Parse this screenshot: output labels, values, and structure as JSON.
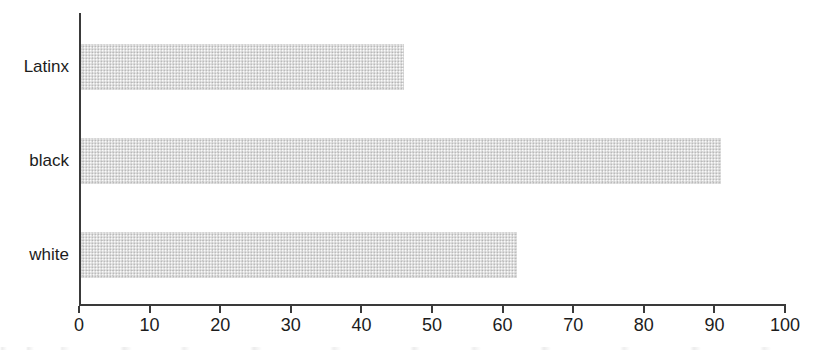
{
  "chart_data": {
    "type": "bar",
    "orientation": "horizontal",
    "title": "",
    "subtitle": "",
    "xlabel": "",
    "ylabel": "",
    "categories": [
      "Latinx",
      "black",
      "white"
    ],
    "values": [
      46,
      91,
      62
    ],
    "series": [
      {
        "name": "",
        "values": [
          46,
          91,
          62
        ]
      }
    ],
    "xlim": [
      0,
      100
    ],
    "xticks": [
      0,
      10,
      20,
      30,
      40,
      50,
      60,
      70,
      80,
      90,
      100
    ],
    "xtick_labels": [
      "0",
      "10",
      "20",
      "30",
      "40",
      "50",
      "60",
      "70",
      "80",
      "90",
      "100"
    ],
    "grid": false,
    "legend": false,
    "legend_position": "none",
    "annotations": [],
    "bar_color": "#dcdcdc",
    "axis_color": "#3a3a3a",
    "text_color": "#1c1c1c",
    "background_color": "#ffffff"
  },
  "axis": {
    "x_tick_labels": [
      "0",
      "10",
      "20",
      "30",
      "40",
      "50",
      "60",
      "70",
      "80",
      "90",
      "100"
    ],
    "y_tick_labels": [
      "Latinx",
      "black",
      "white"
    ]
  }
}
